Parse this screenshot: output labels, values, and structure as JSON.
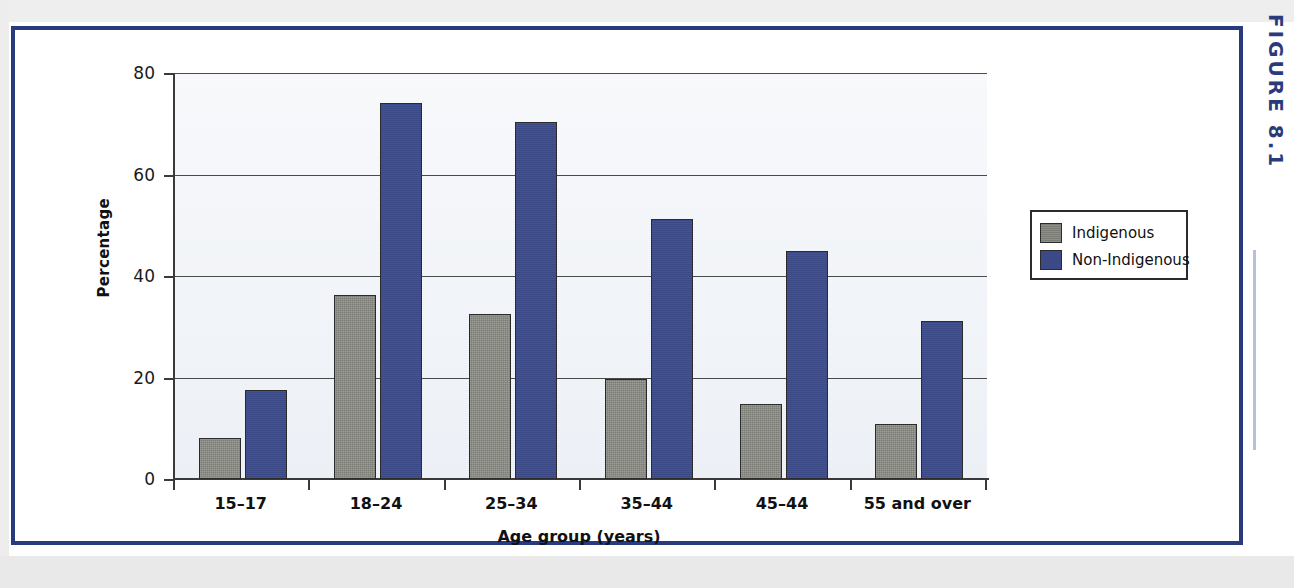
{
  "figure": {
    "tag": "FIGURE 8.1"
  },
  "chart_data": {
    "type": "bar",
    "title": "",
    "xlabel": "Age group (years)",
    "ylabel": "Percentage",
    "ylim": [
      0,
      80
    ],
    "yticks": [
      0,
      20,
      40,
      60,
      80
    ],
    "ytick_labels": [
      "0",
      "20",
      "40",
      "60",
      "80"
    ],
    "grid": true,
    "legend_position": "right",
    "categories": [
      "15–17",
      "18–24",
      "25–34",
      "35–44",
      "45–44",
      "55 and over"
    ],
    "series": [
      {
        "name": "Indigenous",
        "color": "#7c7c76",
        "values": [
          8,
          36.3,
          32.5,
          19.8,
          14.8,
          10.8
        ]
      },
      {
        "name": "Non-Indigenous",
        "color": "#3b4a87",
        "values": [
          17.5,
          74,
          70.3,
          51.3,
          44.9,
          31.2
        ]
      }
    ]
  },
  "legend": {
    "entries": [
      {
        "label": "Indigenous",
        "swatch": "indigenous"
      },
      {
        "label": "Non-Indigenous",
        "swatch": "nonindigenous"
      }
    ]
  },
  "colors": {
    "frame": "#2a3b7d",
    "plot_background": "#eef1f6",
    "axis": "#3a3a3a",
    "indigenous": "#7c7c76",
    "non_indigenous": "#3b4a87"
  }
}
